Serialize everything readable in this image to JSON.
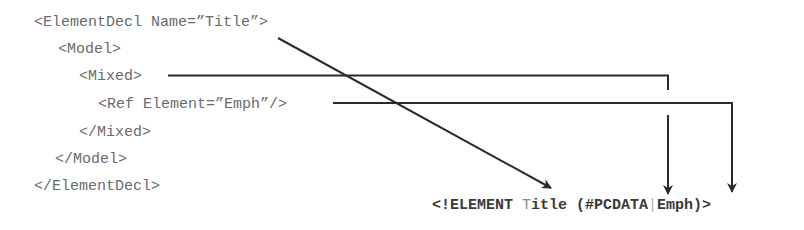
{
  "xml_source": {
    "lines": [
      {
        "text": "<ElementDecl Name=”Title”>",
        "indent": 0
      },
      {
        "text": "<Model>",
        "indent": 1
      },
      {
        "text": "<Mixed>",
        "indent": 2
      },
      {
        "text": "<Ref Element=”Emph”/>",
        "indent": 3
      },
      {
        "text": "</Mixed>",
        "indent": 2
      },
      {
        "text": "</Model>",
        "indent": 1
      },
      {
        "text": "</ElementDecl>",
        "indent": 0
      }
    ]
  },
  "dtd_output": {
    "prefix": "<!ELEMENT ",
    "title_first": "T",
    "title_rest": "itle",
    "open": " (#PCDATA",
    "separator": "|",
    "emph": "Emph",
    "close": ")>"
  },
  "connectors": [
    {
      "from": "ElementDecl Name=”Title”",
      "to": "Title",
      "type": "diagonal-arrow"
    },
    {
      "from": "Mixed",
      "to": "#PCDATA",
      "type": "elbow-arrow"
    },
    {
      "from": "Ref Element=”Emph”",
      "to": "Emph",
      "type": "elbow-arrow"
    }
  ],
  "colors": {
    "text": "#6a6a6a",
    "line": "#2a2a2a",
    "dtd_text": "#3a3a3a"
  }
}
